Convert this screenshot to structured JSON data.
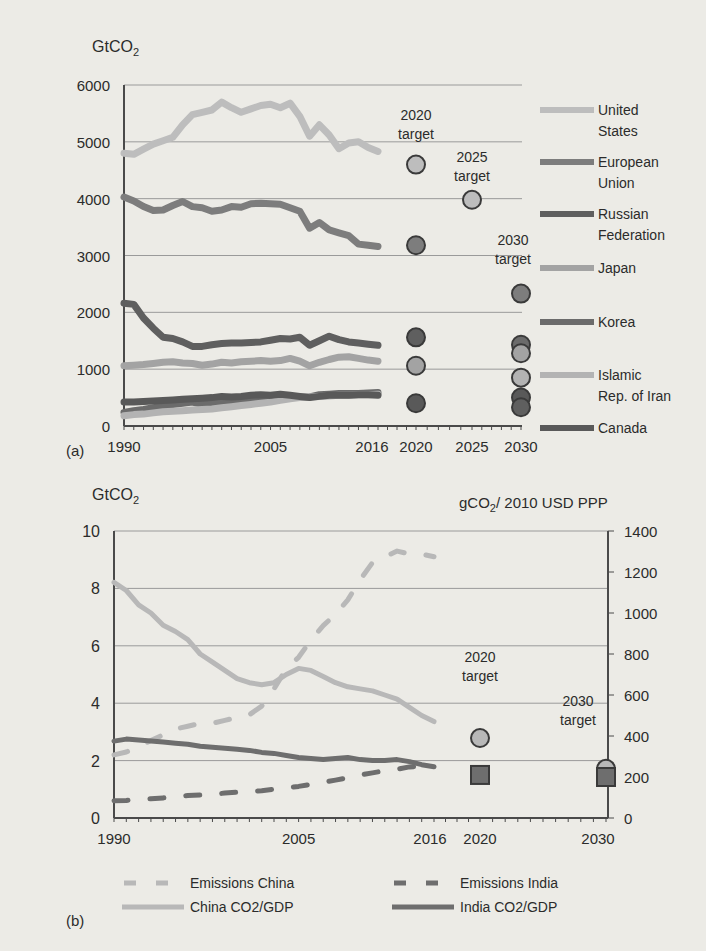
{
  "chart_data": [
    {
      "panel_label": "(a)",
      "type": "line",
      "title": "",
      "ylabel": "GtCO2",
      "xlabel": "",
      "ylim": [
        0,
        6000
      ],
      "yticks": [
        0,
        1000,
        2000,
        3000,
        4000,
        5000,
        6000
      ],
      "xtick_labels": [
        "1990",
        "2005",
        "2016",
        "2020",
        "2025",
        "2030"
      ],
      "grid": true,
      "legend_position": "right",
      "x": [
        1990,
        1991,
        1992,
        1993,
        1994,
        1995,
        1996,
        1997,
        1998,
        1999,
        2000,
        2001,
        2002,
        2003,
        2004,
        2005,
        2006,
        2007,
        2008,
        2009,
        2010,
        2011,
        2012,
        2013,
        2014,
        2015,
        2016
      ],
      "series": [
        {
          "name": "United States",
          "color": "#bdbdbd",
          "values": [
            4800,
            4780,
            4870,
            4960,
            5020,
            5080,
            5300,
            5480,
            5520,
            5560,
            5700,
            5600,
            5520,
            5580,
            5640,
            5660,
            5600,
            5680,
            5450,
            5100,
            5300,
            5120,
            4880,
            4980,
            5000,
            4900,
            4830
          ]
        },
        {
          "name": "European Union",
          "color": "#7d7d7d",
          "values": [
            4030,
            3960,
            3860,
            3790,
            3800,
            3880,
            3950,
            3860,
            3840,
            3780,
            3800,
            3860,
            3850,
            3910,
            3920,
            3910,
            3900,
            3840,
            3780,
            3480,
            3580,
            3450,
            3400,
            3350,
            3200,
            3180,
            3160
          ]
        },
        {
          "name": "Russian Federation",
          "color": "#5f5f5f",
          "values": [
            2160,
            2140,
            1900,
            1720,
            1560,
            1540,
            1480,
            1400,
            1400,
            1430,
            1450,
            1460,
            1460,
            1470,
            1480,
            1510,
            1540,
            1530,
            1560,
            1420,
            1500,
            1580,
            1520,
            1480,
            1460,
            1440,
            1420
          ]
        },
        {
          "name": "Japan",
          "color": "#a3a3a3",
          "values": [
            1060,
            1070,
            1080,
            1100,
            1120,
            1130,
            1110,
            1100,
            1070,
            1090,
            1120,
            1110,
            1130,
            1140,
            1150,
            1140,
            1150,
            1190,
            1140,
            1060,
            1120,
            1170,
            1210,
            1220,
            1190,
            1160,
            1140
          ]
        },
        {
          "name": "Korea",
          "color": "#6b6b6b",
          "values": [
            240,
            270,
            290,
            320,
            350,
            380,
            400,
            420,
            380,
            410,
            430,
            440,
            450,
            460,
            470,
            480,
            480,
            500,
            510,
            510,
            550,
            560,
            570,
            570,
            570,
            580,
            590
          ]
        },
        {
          "name": "Islamic Rep. of Iran",
          "color": "#b3b3b3",
          "values": [
            180,
            200,
            210,
            230,
            250,
            260,
            270,
            280,
            290,
            300,
            320,
            340,
            360,
            380,
            400,
            420,
            450,
            480,
            500,
            510,
            520,
            530,
            540,
            540,
            550,
            550,
            560
          ]
        },
        {
          "name": "Canada",
          "color": "#595959",
          "values": [
            420,
            420,
            430,
            440,
            450,
            460,
            470,
            480,
            490,
            500,
            520,
            510,
            520,
            540,
            550,
            540,
            560,
            540,
            520,
            500,
            520,
            540,
            540,
            540,
            550,
            550,
            540
          ]
        }
      ],
      "targets": [
        {
          "label": "2020 target",
          "year": 2020,
          "points": [
            {
              "series": "United States",
              "value": 4600
            },
            {
              "series": "European Union",
              "value": 3180
            },
            {
              "series": "Russian Federation",
              "value": 1560
            },
            {
              "series": "Japan",
              "value": 1060
            },
            {
              "series": "Canada",
              "value": 400
            }
          ]
        },
        {
          "label": "2025 target",
          "year": 2025,
          "points": [
            {
              "series": "United States",
              "value": 3980
            }
          ]
        },
        {
          "label": "2030 target",
          "year": 2030,
          "points": [
            {
              "series": "European Union",
              "value": 2330
            },
            {
              "series": "Korea",
              "value": 1430
            },
            {
              "series": "Japan",
              "value": 1280
            },
            {
              "series": "Islamic Rep. of Iran",
              "value": 850
            },
            {
              "series": "Canada",
              "value": 500
            },
            {
              "series": "Russian Federation",
              "value": 330
            }
          ]
        }
      ]
    },
    {
      "panel_label": "(b)",
      "type": "line",
      "title": "",
      "ylabel": "GtCO2",
      "ylabel_right": "gCO2/ 2010 USD PPP",
      "ylim": [
        0,
        10
      ],
      "ylim_right": [
        0,
        1400
      ],
      "yticks": [
        0,
        2,
        4,
        6,
        8,
        10
      ],
      "yticks_right": [
        0,
        200,
        400,
        600,
        800,
        1000,
        1200,
        1400
      ],
      "xtick_labels": [
        "1990",
        "2005",
        "2016",
        "2020",
        "2030"
      ],
      "grid": true,
      "legend_position": "bottom",
      "x": [
        1990,
        1991,
        1992,
        1993,
        1994,
        1995,
        1996,
        1997,
        1998,
        1999,
        2000,
        2001,
        2002,
        2003,
        2004,
        2005,
        2006,
        2007,
        2008,
        2009,
        2010,
        2011,
        2012,
        2013,
        2014,
        2015,
        2016
      ],
      "series": [
        {
          "name": "Emissions China",
          "axis": "left",
          "style": "dashed",
          "color": "#b8b8b8",
          "values": [
            2.2,
            2.3,
            2.5,
            2.7,
            2.9,
            3.1,
            3.2,
            3.3,
            3.3,
            3.4,
            3.5,
            3.6,
            3.9,
            4.5,
            5.2,
            5.6,
            6.2,
            6.7,
            7.1,
            7.6,
            8.3,
            8.9,
            9.1,
            9.3,
            9.2,
            9.2,
            9.1
          ]
        },
        {
          "name": "Emissions India",
          "axis": "left",
          "style": "dashed",
          "color": "#6e6e6e",
          "values": [
            0.6,
            0.61,
            0.65,
            0.67,
            0.7,
            0.74,
            0.78,
            0.8,
            0.82,
            0.87,
            0.9,
            0.92,
            0.95,
            1.0,
            1.05,
            1.1,
            1.17,
            1.24,
            1.32,
            1.4,
            1.5,
            1.57,
            1.65,
            1.7,
            1.78,
            1.8,
            1.85
          ]
        },
        {
          "name": "China CO2/GDP",
          "axis": "right",
          "style": "solid",
          "color": "#b8b8b8",
          "values": [
            1150,
            1110,
            1040,
            1000,
            940,
            910,
            870,
            800,
            760,
            720,
            680,
            660,
            650,
            660,
            700,
            730,
            720,
            690,
            660,
            640,
            630,
            620,
            600,
            580,
            540,
            500,
            470
          ]
        },
        {
          "name": "India CO2/GDP",
          "axis": "right",
          "style": "solid",
          "color": "#6e6e6e",
          "values": [
            375,
            385,
            380,
            375,
            370,
            365,
            360,
            350,
            345,
            340,
            335,
            330,
            320,
            315,
            305,
            295,
            290,
            285,
            290,
            295,
            285,
            280,
            280,
            285,
            275,
            260,
            250
          ]
        }
      ],
      "targets": [
        {
          "label": "2020 target",
          "year": 2020,
          "points": [
            {
              "series": "China CO2/GDP",
              "value": 390,
              "shape": "circle"
            },
            {
              "series": "India CO2/GDP",
              "value": 210,
              "shape": "square"
            }
          ]
        },
        {
          "label": "2030 target",
          "year": 2030,
          "points": [
            {
              "series": "China CO2/GDP",
              "value": 240,
              "shape": "circle"
            },
            {
              "series": "India CO2/GDP",
              "value": 200,
              "shape": "square"
            }
          ]
        }
      ]
    }
  ],
  "labels": {
    "a_panel": "(a)",
    "b_panel": "(b)",
    "a_ylabel": "GtCO",
    "b_ylabel_left": "GtCO",
    "b_ylabel_right_pre": "gCO",
    "b_ylabel_right_post": "/ 2010 USD PPP",
    "sub2": "2"
  }
}
